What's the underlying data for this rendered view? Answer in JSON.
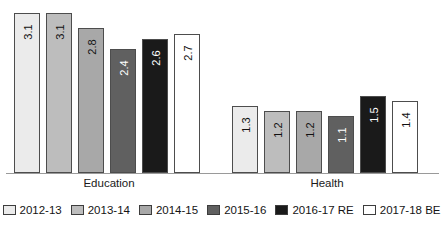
{
  "chart_data": {
    "type": "bar",
    "title": "",
    "subtitle": "",
    "xlabel": "",
    "ylabel": "",
    "categories": [
      "Education",
      "Health"
    ],
    "series": [
      {
        "name": "2012-13",
        "values": [
          3.1,
          1.3
        ],
        "color": "#ebebeb"
      },
      {
        "name": "2013-14",
        "values": [
          3.1,
          1.2
        ],
        "color": "#bdbdbd"
      },
      {
        "name": "2014-15",
        "values": [
          2.8,
          1.2
        ],
        "color": "#a8a8a8"
      },
      {
        "name": "2015-16",
        "values": [
          2.4,
          1.1
        ],
        "color": "#606060"
      },
      {
        "name": "2016-17 RE",
        "values": [
          2.6,
          1.5
        ],
        "color": "#1a1a1a"
      },
      {
        "name": "2017-18 BE",
        "values": [
          2.7,
          1.4
        ],
        "color": "#ffffff"
      }
    ],
    "value_labels": [
      [
        "3.1",
        "3.1",
        "2.8",
        "2.4",
        "2.6",
        "2.7"
      ],
      [
        "1.3",
        "1.2",
        "1.2",
        "1.1",
        "1.5",
        "1.4"
      ]
    ],
    "ylim": [
      0,
      3.35
    ],
    "grid": false,
    "axis_line": true,
    "legend_position": "bottom",
    "label_rotation": -90
  },
  "legend": {
    "items": [
      {
        "label": "2012-13",
        "color": "#ebebeb"
      },
      {
        "label": "2013-14",
        "color": "#bdbdbd"
      },
      {
        "label": "2014-15",
        "color": "#a8a8a8"
      },
      {
        "label": "2015-16",
        "color": "#606060"
      },
      {
        "label": "2016-17 RE",
        "color": "#1a1a1a"
      },
      {
        "label": "2017-18 BE",
        "color": "#ffffff"
      }
    ]
  },
  "axis": {
    "category_labels": [
      "Education",
      "Health"
    ]
  },
  "colors": {
    "baseline": "#9a9a9a",
    "bar_border": "#4d4d4d",
    "text": "#1a1a1a",
    "background": "#ffffff"
  }
}
